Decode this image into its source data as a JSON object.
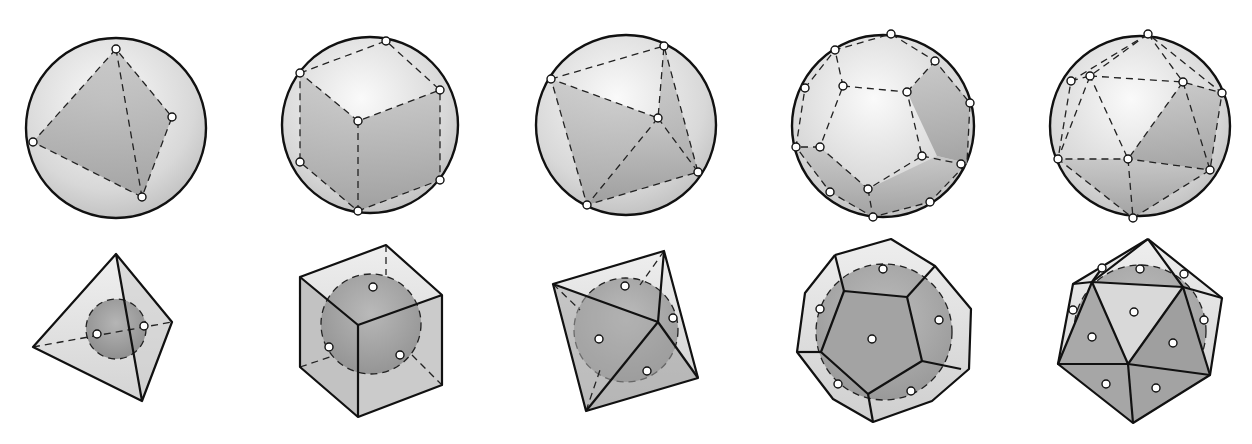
{
  "figure": {
    "solids": [
      {
        "name": "tetrahedron",
        "faces": 4,
        "vertices": 4
      },
      {
        "name": "cube",
        "faces": 6,
        "vertices": 8
      },
      {
        "name": "octahedron",
        "faces": 8,
        "vertices": 6
      },
      {
        "name": "dodecahedron",
        "faces": 12,
        "vertices": 20
      },
      {
        "name": "icosahedron",
        "faces": 20,
        "vertices": 12
      }
    ],
    "rows": [
      "circumscribed-sphere",
      "inscribed-sphere"
    ],
    "colors": {
      "stroke": "#111111",
      "face_shade": "#a8a8a8",
      "sphere_light": "#eeeeee",
      "point_fill": "#ffffff"
    }
  }
}
